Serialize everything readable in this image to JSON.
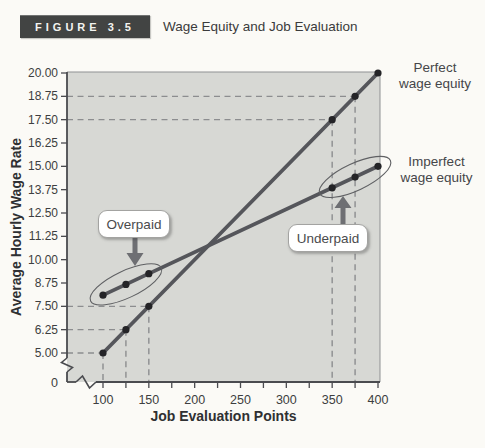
{
  "figure": {
    "label": "FIGURE 3.5",
    "title": "Wage Equity and Job Evaluation"
  },
  "annotations": {
    "overpaid": "Overpaid",
    "underpaid": "Underpaid",
    "perfect": [
      "Perfect",
      "wage equity"
    ],
    "imperfect": [
      "Imperfect",
      "wage equity"
    ],
    "overpaid_target": {
      "x": 125,
      "y": 8.675
    },
    "underpaid_target": {
      "x": 375,
      "y": 14.43
    }
  },
  "chart_data": {
    "type": "line",
    "title": "Wage Equity and Job Evaluation",
    "xlabel": "Job Evaluation Points",
    "ylabel": "Average Hourly Wage Rate",
    "xlim": [
      100,
      400
    ],
    "ylim": [
      5,
      20
    ],
    "axis_break_at_origin": true,
    "origin_label": "0",
    "x_major_ticks": [
      100,
      150,
      200,
      250,
      300,
      350,
      400
    ],
    "x_minor_tick_step": 25,
    "y_tick_step": 1.25,
    "y_tick_labels": [
      "20.00",
      "18.75",
      "17.50",
      "16.25",
      "15.00",
      "13.75",
      "12.50",
      "11.25",
      "10.00",
      "8.75",
      "7.50",
      "6.25",
      "5.00"
    ],
    "grid": false,
    "legend_position": "right-of-line-labels",
    "series": [
      {
        "name": "Perfect wage equity",
        "line": [
          [
            100,
            5.0
          ],
          [
            400,
            20.0
          ]
        ],
        "points": [
          [
            100,
            5.0
          ],
          [
            125,
            6.25
          ],
          [
            150,
            7.5
          ],
          [
            350,
            17.5
          ],
          [
            375,
            18.75
          ],
          [
            400,
            20.0
          ]
        ]
      },
      {
        "name": "Imperfect wage equity",
        "line": [
          [
            100,
            8.1
          ],
          [
            400,
            15.0
          ]
        ],
        "points": [
          [
            100,
            8.1
          ],
          [
            125,
            8.675
          ],
          [
            150,
            9.25
          ],
          [
            350,
            13.85
          ],
          [
            375,
            14.425
          ],
          [
            400,
            15.0
          ]
        ]
      }
    ],
    "dashed_guide_points": [
      [
        100,
        5.0
      ],
      [
        125,
        6.25
      ],
      [
        150,
        7.5
      ],
      [
        350,
        17.5
      ],
      [
        375,
        18.75
      ]
    ]
  },
  "colors": {
    "page_bg": "#fbfaf6",
    "plot_bg": "#d7d8d4",
    "axis": "#4a4b4f",
    "plot_border": "#8f9193",
    "dash": "#8c8d8f",
    "series_line": "#55565b",
    "data_point": "#242427",
    "tick_text": "#3d3e40",
    "annotation_text": "#454649",
    "arrow": "#6e6f73",
    "ellipse": "#5f6063",
    "callout_border": "#a3a3a1",
    "badge_bg": "#424443",
    "badge_text": "#f4f4f1"
  }
}
